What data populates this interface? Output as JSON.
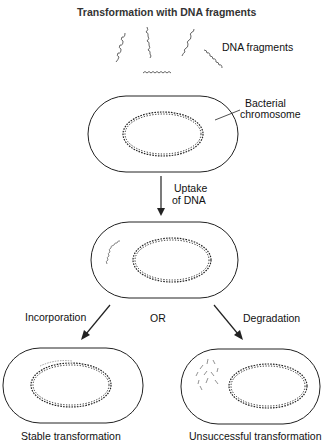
{
  "title": "Transformation with DNA fragments",
  "labels": {
    "dna_fragments": "DNA fragments",
    "bacterial_chromosome_line1": "Bacterial",
    "bacterial_chromosome_line2": "chromosome",
    "uptake_line1": "Uptake",
    "uptake_line2": "of DNA",
    "incorporation": "Incorporation",
    "or": "OR",
    "degradation": "Degradation",
    "stable": "Stable transformation",
    "unsuccessful": "Unsuccessful transformation"
  },
  "colors": {
    "line": "#222222",
    "fragment": "#555555",
    "incorporated": "#999999"
  }
}
